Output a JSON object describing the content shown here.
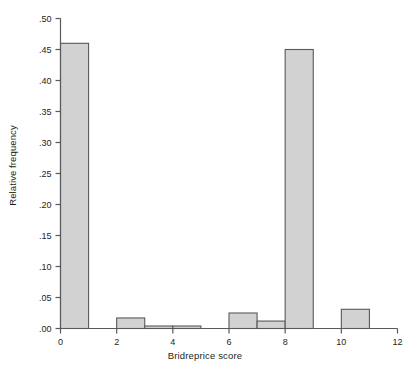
{
  "chart_data": {
    "type": "bar",
    "title": "",
    "xlabel": "Bridreprice score",
    "ylabel": "Relative frequency",
    "xlim": [
      0,
      12
    ],
    "ylim": [
      0,
      0.5
    ],
    "grid": false,
    "legend": "none",
    "bar_style": "histogram-adjacent",
    "fill_color": "#d2d2d2",
    "edge_color": "#58595b",
    "axis_color": "#58595b",
    "x_tick_labels": [
      "0",
      "2",
      "4",
      "6",
      "8",
      "10",
      "12"
    ],
    "x_tick_values": [
      0,
      2,
      4,
      6,
      8,
      10,
      12
    ],
    "y_tick_labels": [
      ".00",
      ".05",
      ".10",
      ".15",
      ".20",
      ".25",
      ".30",
      ".35",
      ".40",
      ".45",
      ".50"
    ],
    "y_tick_values": [
      0.0,
      0.05,
      0.1,
      0.15,
      0.2,
      0.25,
      0.3,
      0.35,
      0.4,
      0.45,
      0.5
    ],
    "bins": [
      {
        "label": "0-1",
        "x0": 0,
        "x1": 1,
        "value": 0.46
      },
      {
        "label": "2-3",
        "x0": 2,
        "x1": 3,
        "value": 0.017
      },
      {
        "label": "3-4",
        "x0": 3,
        "x1": 4,
        "value": 0.004
      },
      {
        "label": "4-5",
        "x0": 4,
        "x1": 5,
        "value": 0.004
      },
      {
        "label": "6-7",
        "x0": 6,
        "x1": 7,
        "value": 0.025
      },
      {
        "label": "7-8",
        "x0": 7,
        "x1": 8,
        "value": 0.012
      },
      {
        "label": "8-9",
        "x0": 8,
        "x1": 9,
        "value": 0.45
      },
      {
        "label": "10-11",
        "x0": 10,
        "x1": 11,
        "value": 0.031
      }
    ],
    "categories": [
      "0-1",
      "2-3",
      "3-4",
      "4-5",
      "6-7",
      "7-8",
      "8-9",
      "10-11"
    ],
    "values": [
      0.46,
      0.017,
      0.004,
      0.004,
      0.025,
      0.012,
      0.45,
      0.031
    ]
  }
}
